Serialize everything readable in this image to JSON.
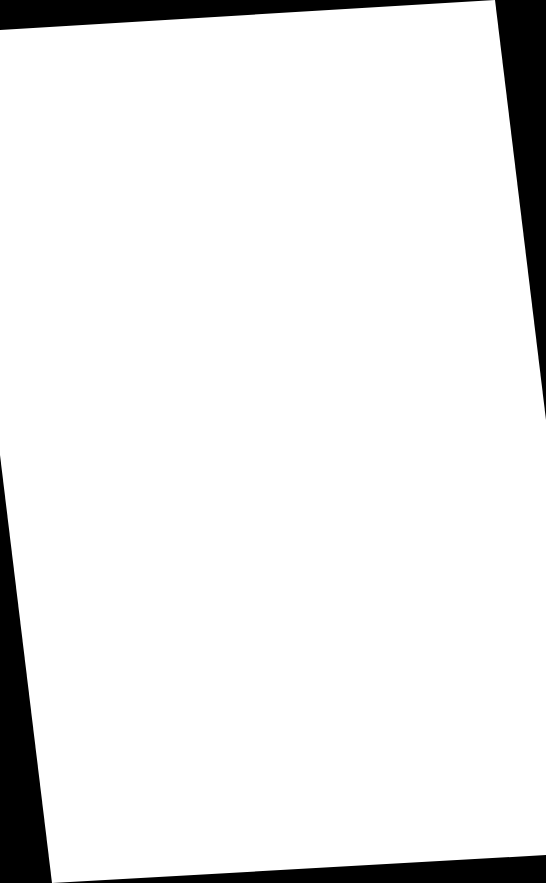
{
  "scene": {
    "background_color": "#000000",
    "page": {
      "color": "#ffffff",
      "content": "",
      "rotation_deg": -3.5
    }
  }
}
